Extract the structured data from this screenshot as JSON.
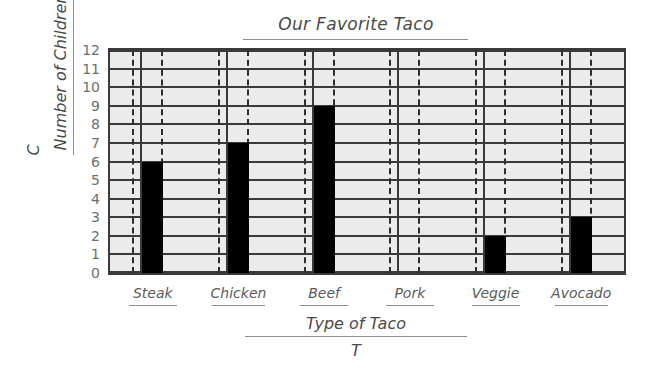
{
  "chart_data": {
    "type": "bar",
    "title": "Our Favorite Taco",
    "xlabel": "Type of Taco",
    "ylabel": "Number of Children",
    "x_variable": "T",
    "y_variable": "C",
    "categories": [
      "Steak",
      "Chicken",
      "Beef",
      "Pork",
      "Veggie",
      "Avocado"
    ],
    "values": [
      6,
      7,
      9,
      0,
      2,
      3
    ],
    "ylim": [
      0,
      12
    ],
    "ytick_labels": [
      "12",
      "11",
      "10",
      "9",
      "8",
      "7",
      "6",
      "5",
      "4",
      "3",
      "2",
      "1",
      "0"
    ],
    "ytick_values": [
      12,
      11,
      10,
      9,
      8,
      7,
      6,
      5,
      4,
      3,
      2,
      1,
      0
    ],
    "grid": "horizontal-and-vertical",
    "legend": "none",
    "bar_color": "#000000",
    "plot_background": "#ebebeb",
    "grid_color": "#3a3a3a",
    "text_color": "#4a4a4a"
  }
}
